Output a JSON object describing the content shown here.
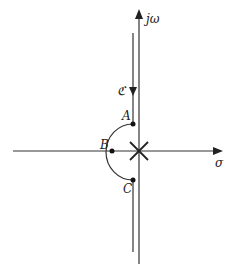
{
  "diagram": {
    "axes": {
      "real_label": "σ",
      "imag_label": "jω"
    },
    "contour_label": "ℭ",
    "points": [
      {
        "id": "A",
        "label": "A"
      },
      {
        "id": "B",
        "label": "B"
      },
      {
        "id": "C",
        "label": "C"
      }
    ],
    "pole_marker": "×",
    "colors": {
      "line": "#333333",
      "background": "#ffffff"
    }
  }
}
